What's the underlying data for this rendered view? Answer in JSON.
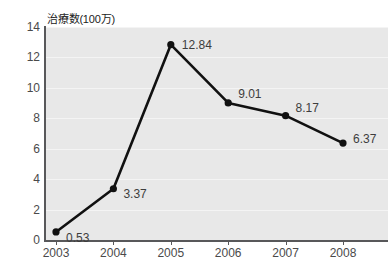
{
  "chart_data": {
    "type": "line",
    "title": "",
    "xlabel": "",
    "ylabel": "治療数(100万)",
    "categories": [
      "2003",
      "2004",
      "2005",
      "2006",
      "2007",
      "2008"
    ],
    "values": [
      0.53,
      3.37,
      12.84,
      9.01,
      8.17,
      6.37
    ],
    "point_labels": [
      "0.53",
      "3.37",
      "12.84",
      "9.01",
      "8.17",
      "6.37"
    ],
    "ylim": [
      0,
      14
    ],
    "y_ticks": [
      0,
      2,
      4,
      6,
      8,
      10,
      12,
      14
    ],
    "y_tick_labels": [
      "0",
      "2",
      "4",
      "6",
      "8",
      "10",
      "12",
      "14"
    ],
    "grid": true,
    "legend": "none",
    "series": [
      {
        "name": "治療数(100万)",
        "values": [
          0.53,
          3.37,
          12.84,
          9.01,
          8.17,
          6.37
        ]
      }
    ]
  },
  "style": {
    "line_color": "#111111",
    "marker_color": "#111111",
    "plot_background": "#e8e8e8",
    "gridline_color": "#f4f4f4",
    "axis_color": "#58585a",
    "tick_label_color": "#4a4a4a",
    "point_label_color": "#3d3d3d"
  }
}
